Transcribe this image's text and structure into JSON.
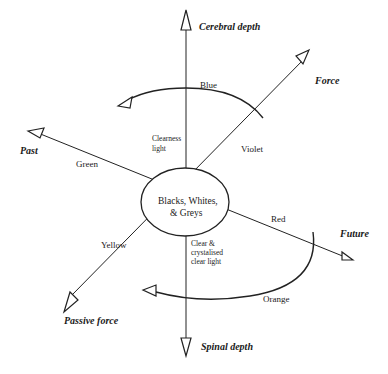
{
  "diagram": {
    "type": "axis-diagram",
    "center": {
      "line1": "Blacks, Whites,",
      "line2": "& Greys"
    },
    "axes": {
      "up": "Cerebral depth",
      "down": "Spinal depth",
      "upper_right": "Force",
      "lower_left": "Passive force",
      "left": "Past",
      "right": "Future"
    },
    "colors": {
      "top_arc": "Blue",
      "upper_right": "Violet",
      "left": "Green",
      "right": "Red",
      "lower_left": "Yellow",
      "bottom_arc": "Orange"
    },
    "notes": {
      "upper": [
        "Clearness",
        "light"
      ],
      "lower": [
        "Clear &",
        "crystalised",
        "clear light"
      ]
    }
  }
}
